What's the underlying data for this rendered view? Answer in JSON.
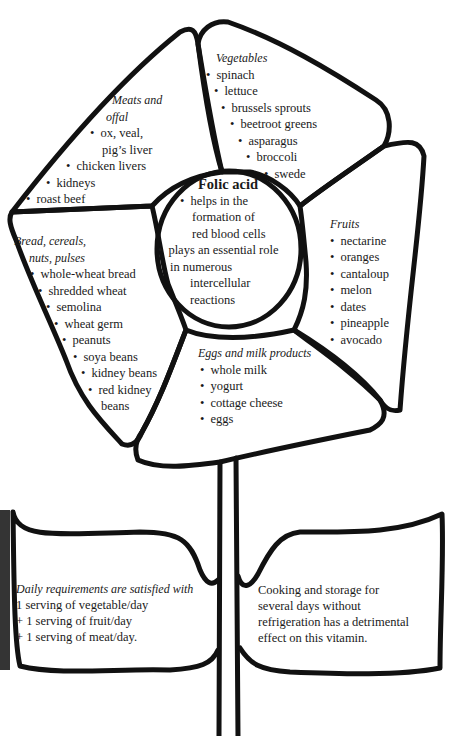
{
  "center": {
    "title": "Folic acid",
    "points": [
      [
        "helps in the",
        "formation of",
        "red blood cells"
      ],
      [
        "plays an essential role",
        "in numerous",
        "intercellular",
        "reactions"
      ]
    ]
  },
  "petals": {
    "meats": {
      "heading": [
        "Meats and",
        "offal"
      ],
      "items": [
        [
          "ox, veal,",
          "pig’s liver"
        ],
        [
          "chicken livers"
        ],
        [
          "kidneys"
        ],
        [
          "roast beef"
        ]
      ]
    },
    "vegetables": {
      "heading": [
        "Vegetables"
      ],
      "items": [
        [
          "spinach"
        ],
        [
          "lettuce"
        ],
        [
          "brussels sprouts"
        ],
        [
          "beetroot greens"
        ],
        [
          "asparagus"
        ],
        [
          "broccoli"
        ],
        [
          "swede"
        ]
      ]
    },
    "fruits": {
      "heading": [
        "Fruits"
      ],
      "items": [
        [
          "nectarine"
        ],
        [
          "oranges"
        ],
        [
          "cantaloup"
        ],
        [
          "melon"
        ],
        [
          "dates"
        ],
        [
          "pineapple"
        ],
        [
          "avocado"
        ]
      ]
    },
    "eggs_milk": {
      "heading": [
        "Eggs and milk products"
      ],
      "items": [
        [
          "whole milk"
        ],
        [
          "yogurt"
        ],
        [
          "cottage cheese"
        ],
        [
          "eggs"
        ]
      ]
    },
    "bread": {
      "heading": [
        "Bread, cereals,",
        "nuts, pulses"
      ],
      "items": [
        [
          "whole-wheat bread"
        ],
        [
          "shredded wheat"
        ],
        [
          "semolina"
        ],
        [
          "wheat germ"
        ],
        [
          "peanuts"
        ],
        [
          "soya beans"
        ],
        [
          "kidney beans"
        ],
        [
          "red kidney",
          "beans"
        ]
      ]
    }
  },
  "leaves": {
    "left": {
      "intro": "Daily requirements are satisfied with",
      "lines": [
        "1 serving of vegetable/day",
        "+ 1 serving of fruit/day",
        "+ 1 serving of meat/day."
      ]
    },
    "right": {
      "lines": [
        "Cooking and storage for",
        "several days without",
        "refrigeration has a detrimental",
        "effect on this vitamin."
      ]
    }
  },
  "colors": {
    "ink": "#111111",
    "paper": "#ffffff",
    "text": "#1a1a1a"
  }
}
